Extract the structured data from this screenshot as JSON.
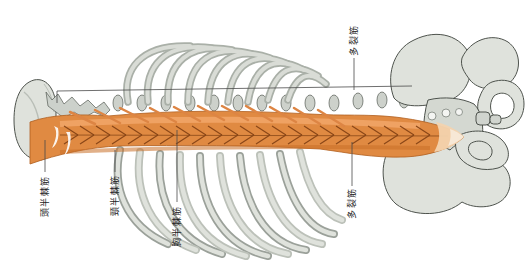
{
  "labels": [
    {
      "id": "semispinalis-capitis",
      "text": "頭半棘筋"
    },
    {
      "id": "semispinalis-cervicis",
      "text": "頸半棘筋"
    },
    {
      "id": "semispinalis-thoracis",
      "text": "胸半棘筋"
    },
    {
      "id": "multifidus-span",
      "text": "多裂筋"
    },
    {
      "id": "multifidus-lumbar",
      "text": "多裂筋"
    }
  ],
  "colors": {
    "background": "#ffffff",
    "bone": "#dfe2dc",
    "bone_shade": "#aab0a8",
    "bone_outline": "#4e534d",
    "muscle": "#e08a42",
    "muscle_highlight": "#f2a86c",
    "muscle_shadow": "#c86f28",
    "muscle_fiber": "#8a4718",
    "tendon": "#ffffff",
    "leader_line": "#4a4a4a",
    "text": "#1f1f1f"
  }
}
